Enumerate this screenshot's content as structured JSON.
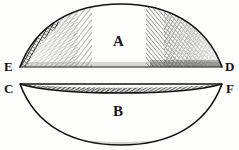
{
  "figure": {
    "style": "engraving",
    "background_color": "#fdfdfc",
    "ink_color": "#141414",
    "width": 239,
    "height": 150,
    "region_labels": [
      {
        "id": "A",
        "text": "A",
        "x": 118,
        "y": 41,
        "describes": "upper plano-convex segment"
      },
      {
        "id": "B",
        "text": "B",
        "x": 118,
        "y": 111,
        "describes": "lower concavo-convex segment"
      }
    ],
    "vertex_labels": [
      {
        "id": "E",
        "text": "E",
        "x": 8,
        "y": 66,
        "describes": "left end of upper segment flat face"
      },
      {
        "id": "D",
        "text": "D",
        "x": 229,
        "y": 66,
        "describes": "right end of upper segment flat face"
      },
      {
        "id": "C",
        "text": "C",
        "x": 8,
        "y": 88,
        "describes": "left end of lower segment upper face"
      },
      {
        "id": "F",
        "text": "F",
        "x": 230,
        "y": 88,
        "describes": "right end of lower segment upper face"
      }
    ],
    "geometry": {
      "upper_segment": {
        "name": "A",
        "left_point": [
          20,
          67
        ],
        "right_point": [
          222,
          67
        ],
        "apex": [
          121,
          4
        ],
        "base_line_y": 67,
        "hatching": "cross-hatch along inner left and inner right flanks, densest at right"
      },
      "lower_segment": {
        "name": "B",
        "left_point": [
          20,
          84
        ],
        "right_point": [
          222,
          84
        ],
        "nadir": [
          121,
          145
        ],
        "top_line_y": 84,
        "inner_sliver_depth": 11,
        "hatching": "cross-hatch along inner lower-left and lower-right flanks, densest at right"
      }
    }
  }
}
